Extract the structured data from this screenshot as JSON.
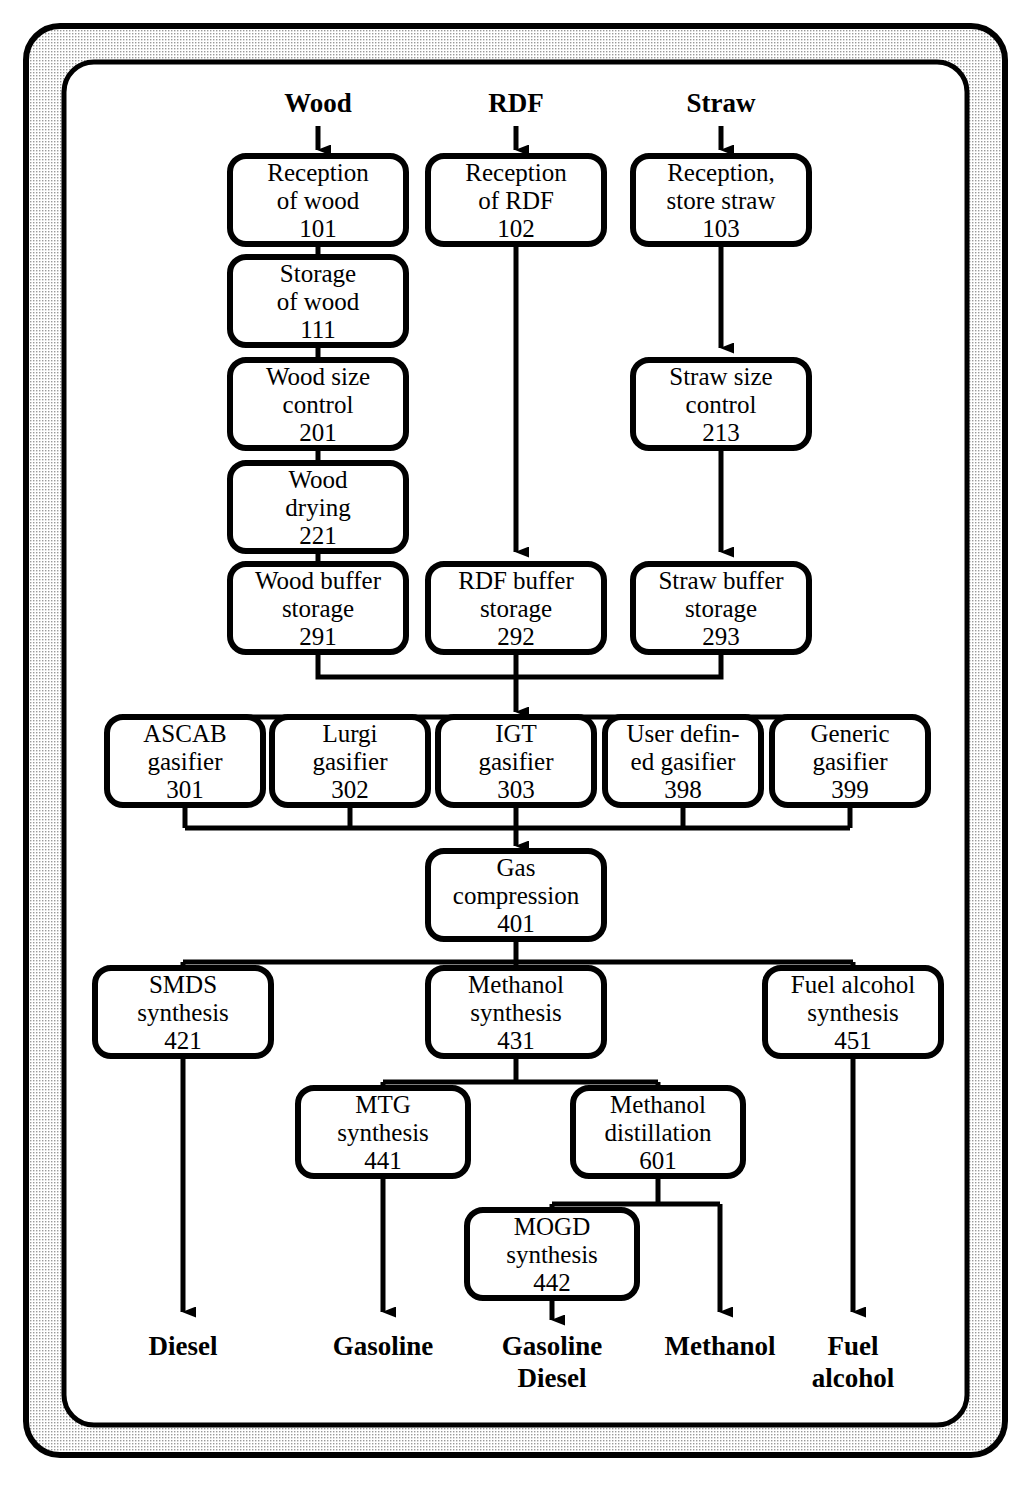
{
  "diagram": {
    "frame": {
      "style": "double rounded rectangle with halftone band",
      "band_color": "#d8d8d8",
      "line_color": "#000000"
    },
    "inputs": [
      {
        "name": "input-wood",
        "label": "Wood",
        "x": 318
      },
      {
        "name": "input-rdf",
        "label": "RDF",
        "x": 516
      },
      {
        "name": "input-straw",
        "label": "Straw",
        "x": 721
      }
    ],
    "nodes": [
      {
        "id": "101",
        "name": "reception-of-wood",
        "lines": [
          "Reception",
          "of wood"
        ],
        "code": "101",
        "x": 318,
        "y": 200,
        "w": 176,
        "h": 88
      },
      {
        "id": "102",
        "name": "reception-of-rdf",
        "lines": [
          "Reception",
          "of RDF"
        ],
        "code": "102",
        "x": 516,
        "y": 200,
        "w": 176,
        "h": 88
      },
      {
        "id": "103",
        "name": "reception-store-straw",
        "lines": [
          "Reception,",
          "store straw"
        ],
        "code": "103",
        "x": 721,
        "y": 200,
        "w": 176,
        "h": 88
      },
      {
        "id": "111",
        "name": "storage-of-wood",
        "lines": [
          "Storage",
          "of wood"
        ],
        "code": "111",
        "x": 318,
        "y": 301,
        "w": 176,
        "h": 88
      },
      {
        "id": "201",
        "name": "wood-size-control",
        "lines": [
          "Wood size",
          "control"
        ],
        "code": "201",
        "x": 318,
        "y": 404,
        "w": 176,
        "h": 88
      },
      {
        "id": "221",
        "name": "wood-drying",
        "lines": [
          "Wood",
          "drying"
        ],
        "code": "221",
        "x": 318,
        "y": 507,
        "w": 176,
        "h": 88
      },
      {
        "id": "213",
        "name": "straw-size-control",
        "lines": [
          "Straw size",
          "control"
        ],
        "code": "213",
        "x": 721,
        "y": 404,
        "w": 176,
        "h": 88
      },
      {
        "id": "291",
        "name": "wood-buffer-storage",
        "lines": [
          "Wood buffer",
          "storage"
        ],
        "code": "291",
        "x": 318,
        "y": 608,
        "w": 176,
        "h": 88
      },
      {
        "id": "292",
        "name": "rdf-buffer-storage",
        "lines": [
          "RDF buffer",
          "storage"
        ],
        "code": "292",
        "x": 516,
        "y": 608,
        "w": 176,
        "h": 88
      },
      {
        "id": "293",
        "name": "straw-buffer-storage",
        "lines": [
          "Straw buffer",
          "storage"
        ],
        "code": "293",
        "x": 721,
        "y": 608,
        "w": 176,
        "h": 88
      },
      {
        "id": "301",
        "name": "ascab-gasifier",
        "lines": [
          "ASCAB",
          "gasifier"
        ],
        "code": "301",
        "x": 185,
        "y": 761,
        "w": 156,
        "h": 88
      },
      {
        "id": "302",
        "name": "lurgi-gasifier",
        "lines": [
          "Lurgi",
          "gasifier"
        ],
        "code": "302",
        "x": 350,
        "y": 761,
        "w": 156,
        "h": 88
      },
      {
        "id": "303",
        "name": "igt-gasifier",
        "lines": [
          "IGT",
          "gasifier"
        ],
        "code": "303",
        "x": 516,
        "y": 761,
        "w": 156,
        "h": 88
      },
      {
        "id": "398",
        "name": "user-defined-gasifier",
        "lines": [
          "User defin-",
          "ed gasifier"
        ],
        "code": "398",
        "x": 683,
        "y": 761,
        "w": 156,
        "h": 88
      },
      {
        "id": "399",
        "name": "generic-gasifier",
        "lines": [
          "Generic",
          "gasifier"
        ],
        "code": "399",
        "x": 850,
        "y": 761,
        "w": 156,
        "h": 88
      },
      {
        "id": "401",
        "name": "gas-compression",
        "lines": [
          "Gas",
          "compression"
        ],
        "code": "401",
        "x": 516,
        "y": 895,
        "w": 176,
        "h": 88
      },
      {
        "id": "421",
        "name": "smds-synthesis",
        "lines": [
          "SMDS",
          "synthesis"
        ],
        "code": "421",
        "x": 183,
        "y": 1012,
        "w": 176,
        "h": 88
      },
      {
        "id": "431",
        "name": "methanol-synthesis",
        "lines": [
          "Methanol",
          "synthesis"
        ],
        "code": "431",
        "x": 516,
        "y": 1012,
        "w": 176,
        "h": 88
      },
      {
        "id": "451",
        "name": "fuel-alcohol-synthesis",
        "lines": [
          "Fuel alcohol",
          "synthesis"
        ],
        "code": "451",
        "x": 853,
        "y": 1012,
        "w": 176,
        "h": 88
      },
      {
        "id": "441",
        "name": "mtg-synthesis",
        "lines": [
          "MTG",
          "synthesis"
        ],
        "code": "441",
        "x": 383,
        "y": 1132,
        "w": 170,
        "h": 88
      },
      {
        "id": "601",
        "name": "methanol-distillation",
        "lines": [
          "Methanol",
          "distillation"
        ],
        "code": "601",
        "x": 658,
        "y": 1132,
        "w": 170,
        "h": 88
      },
      {
        "id": "442",
        "name": "mogd-synthesis",
        "lines": [
          "MOGD",
          "synthesis"
        ],
        "code": "442",
        "x": 552,
        "y": 1254,
        "w": 170,
        "h": 88
      }
    ],
    "outputs": [
      {
        "name": "output-diesel",
        "lines": [
          "Diesel"
        ],
        "x": 183
      },
      {
        "name": "output-gasoline",
        "lines": [
          "Gasoline"
        ],
        "x": 383
      },
      {
        "name": "output-gasoline-diesel",
        "lines": [
          "Gasoline",
          "Diesel"
        ],
        "x": 552
      },
      {
        "name": "output-methanol",
        "lines": [
          "Methanol"
        ],
        "x": 720
      },
      {
        "name": "output-fuel-alcohol",
        "lines": [
          "Fuel",
          "alcohol"
        ],
        "x": 853
      }
    ]
  }
}
